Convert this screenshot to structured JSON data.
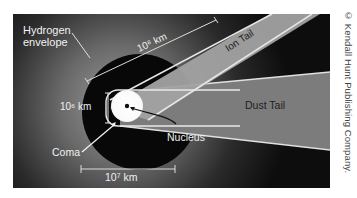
{
  "diagram": {
    "labels": {
      "hydrogen_envelope_line1": "Hydrogen",
      "hydrogen_envelope_line2": "envelope",
      "scale_1e8": "10⁸ km",
      "scale_1e6": "10⁶ km",
      "scale_1e7": "10⁷ km",
      "ion_tail": "Ion Tail",
      "dust_tail": "Dust Tail",
      "coma": "Coma",
      "nucleus": "Nucleus"
    },
    "credit": "© Kendall Hunt Publishing Company."
  },
  "colors": {
    "background": "#0a0a0a",
    "hydrogen_glow": "#8a8a8a",
    "ion_tail": "#9a9a9a",
    "dust_tail": "#7a7a7a",
    "coma": "#ffffff",
    "line": "#e6e6e6",
    "label_dark": "#222222",
    "label_light": "#f2f2f2"
  }
}
